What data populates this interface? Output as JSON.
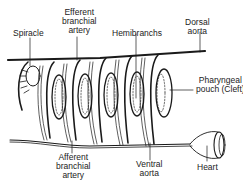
{
  "diagram": {
    "labels": {
      "spiracle": "Spiracle",
      "efferent_branchial_artery": [
        "Efferent",
        "branchial",
        "artery"
      ],
      "hemibranchs": "Hemibranchs",
      "dorsal_aorta": [
        "Dorsal",
        "aorta"
      ],
      "pharyngeal_pouch": [
        "Pharyngeal",
        "pouch (Cleft)"
      ],
      "afferent_branchial_artery": [
        "Afferent",
        "branchial",
        "artery"
      ],
      "ventral_aorta": [
        "Ventral",
        "aorta"
      ],
      "heart": "Heart"
    },
    "colors": {
      "line": "#1a1a1a",
      "background": "#ffffff",
      "text": "#222222"
    }
  }
}
